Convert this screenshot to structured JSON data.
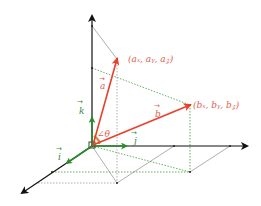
{
  "diagram": {
    "colors": {
      "axis": "#111111",
      "vector": "#e8402a",
      "unit_vector": "#2a8a2a",
      "guide_gray": "#9a9a9a",
      "guide_green": "#3a9a3a",
      "label_red": "#e06050",
      "label_green": "#3a8a3a"
    },
    "labels": {
      "point_a": "(aₓ, aᵧ, a𝓏)",
      "point_b": "(bₓ, bᵧ, b𝓏)",
      "vector_a": "a",
      "vector_b": "b",
      "angle": "∠θ",
      "unit_i": "i",
      "unit_j": "j",
      "unit_k": "k"
    },
    "arrow_mark": "→"
  }
}
